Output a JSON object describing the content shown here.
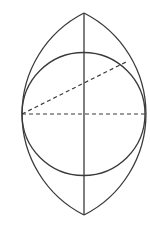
{
  "diagram": {
    "type": "geometric-construction",
    "colors": {
      "background": "#ffffff",
      "stroke": "#3a3a3a"
    },
    "elements": {
      "lens": {
        "top_apex": [
          84,
          13
        ],
        "bottom_apex": [
          84,
          215
        ],
        "left_point": [
          22,
          114
        ],
        "right_point": [
          145,
          114
        ],
        "arc_radius": 113.3
      },
      "circle": {
        "center": [
          83.5,
          114
        ],
        "radius": 61.5
      },
      "vertical_axis": {
        "from": [
          84,
          13
        ],
        "to": [
          84,
          215
        ]
      },
      "horizontal_diameter": {
        "from": [
          22,
          114
        ],
        "to": [
          145,
          114
        ],
        "style": "dashed"
      },
      "diagonal_chord": {
        "from": [
          22,
          114
        ],
        "to": [
          128,
          61
        ],
        "style": "dashed"
      }
    },
    "labels": []
  }
}
